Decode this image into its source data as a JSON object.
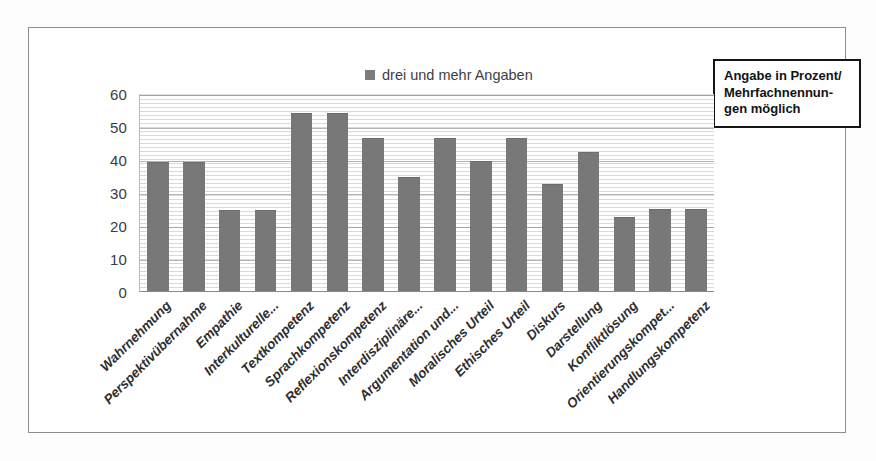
{
  "chart_data": {
    "type": "bar",
    "title": "",
    "subtitle": "",
    "xlabel": "",
    "ylabel": "",
    "ylim": [
      0,
      60
    ],
    "ytick_step": 10,
    "yticks": [
      60,
      50,
      40,
      30,
      20,
      10,
      0
    ],
    "grid": true,
    "legend_position": "top-center",
    "categories": [
      "Wahrnehmung",
      "Perspektivübernahme",
      "Empathie",
      "Interkulturelle...",
      "Textkompetenz",
      "Sprachkompetenz",
      "Reflexionskompetenz",
      "Interdisziplinäre...",
      "Argumentation und...",
      "Moralisches Urteil",
      "Ethisches Urteil",
      "Diskurs",
      "Darstellung",
      "Konfliktlösung",
      "Orientierungskompet...",
      "Handlungskompetenz"
    ],
    "series": [
      {
        "name": "drei und mehr Angaben",
        "color": "#787878",
        "values": [
          39,
          39,
          24.5,
          24.5,
          54,
          54,
          46.5,
          34.5,
          46.5,
          39.5,
          46.5,
          32.5,
          42,
          22.5,
          25,
          25
        ]
      }
    ]
  },
  "legend": {
    "marker": "legend-swatch-square",
    "label": "drei und mehr Angaben"
  },
  "note_box": {
    "lines": [
      "Angabe in Prozent/",
      "Mehrfachnennun-",
      "gen möglich"
    ]
  },
  "colors": {
    "bar": "#787878",
    "frame": "#8d8d8d",
    "note_border": "#151515",
    "axis_text": "#3b3b3b",
    "label_text": "#2e2e2e"
  }
}
